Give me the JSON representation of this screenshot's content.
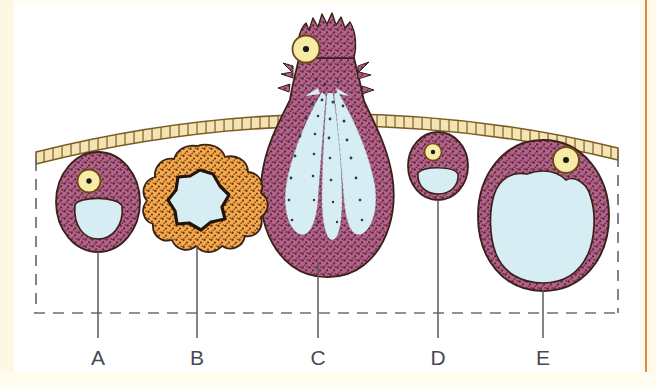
{
  "figure": {
    "background_color": "#ffffff",
    "page_border_color": "#fdf8e4",
    "page_accent_rule_color": "#e08a3c"
  },
  "palette": {
    "cytoplasm_purple": "#9e4a70",
    "cytoplasm_purple_light": "#b16487",
    "cytoplasm_orange": "#f09232",
    "cytoplasm_orange_light": "#f5a94f",
    "vacuole_blue": "#d6edf3",
    "nucleus_yellow": "#f7eba6",
    "nucleolus_black": "#1a1a1a",
    "outline_dark": "#3a2118",
    "membrane_cream": "#f4e3b4",
    "membrane_outline": "#8a6a2c",
    "leader_line": "#5a5a62",
    "dashed_box": "#6d6d75",
    "label_color": "#4a4a52"
  },
  "basement_membrane": {
    "name": "basement membrane",
    "style": "segmented cream band arcing across the top",
    "segment_count": 56
  },
  "dashed_box": {
    "name": "epithelium boundary box",
    "style": "dashed",
    "left": 35,
    "right": 618,
    "bottom": 313
  },
  "cells": [
    {
      "label": "A",
      "name": "immature-mucous-cell",
      "description": "Small rounded purple cell with apical nucleus and one small pale vacuole",
      "cytoplasm_color": "#9e4a70",
      "vacuole_color": "#d6edf3",
      "nucleus_color": "#f7eba6",
      "label_x": 98,
      "leader_top": 252,
      "leader_bottom": 338
    },
    {
      "label": "B",
      "name": "lobed-orange-cell",
      "description": "Orange stippled cell with many rounded lobes around an irregular star-shaped lumen",
      "cytoplasm_color": "#f09232",
      "vacuole_color": "#d6edf3",
      "nucleus_color": "",
      "label_x": 197,
      "leader_top": 246,
      "leader_bottom": 338
    },
    {
      "label": "C",
      "name": "discharging-goblet-cell",
      "description": "Large flask-shaped cell bursting through the membrane, three elongated vacuoles releasing stippled secretion",
      "cytoplasm_color": "#9e4a70",
      "vacuole_color": "#d6edf3",
      "nucleus_color": "#f7eba6",
      "label_x": 318,
      "leader_top": 262,
      "leader_bottom": 338
    },
    {
      "label": "D",
      "name": "small-mucous-cell",
      "description": "Smallest purple cell with apical nucleus and a crescent-shaped pale vacuole",
      "cytoplasm_color": "#9e4a70",
      "vacuole_color": "#d6edf3",
      "nucleus_color": "#f7eba6",
      "label_x": 438,
      "leader_top": 200,
      "leader_bottom": 338
    },
    {
      "label": "E",
      "name": "distended-mucous-cell",
      "description": "Large purple cell almost entirely filled by one pale vacuole, nucleus displaced to the apex",
      "cytoplasm_color": "#9e4a70",
      "vacuole_color": "#d6edf3",
      "nucleus_color": "#f7eba6",
      "label_x": 543,
      "leader_top": 290,
      "leader_bottom": 338
    }
  ]
}
